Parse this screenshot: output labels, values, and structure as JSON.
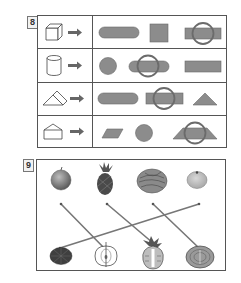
{
  "question_8": {
    "number": "8",
    "rows": [
      {
        "solid": "cube",
        "arrow": "arrow-right",
        "options": [
          "rounded-rectangle",
          "square",
          "rectangle"
        ],
        "circled_option_index": 2
      },
      {
        "solid": "cylinder",
        "arrow": "arrow-right",
        "options": [
          "circle",
          "rounded-rectangle",
          "rectangle"
        ],
        "circled_option_index": 1
      },
      {
        "solid": "triangular-prism",
        "arrow": "arrow-right",
        "options": [
          "rounded-rectangle",
          "rectangle",
          "triangle"
        ],
        "circled_option_index": 1
      },
      {
        "solid": "pentagonal-house-prism",
        "arrow": "arrow-right",
        "options": [
          "parallelogram",
          "circle",
          "trapezoid"
        ],
        "circled_option_index": 2
      }
    ]
  },
  "question_9": {
    "number": "9",
    "top_items": [
      "apple",
      "pineapple",
      "cabbage",
      "orange"
    ],
    "bottom_items": [
      "orange-cross-section",
      "apple-cross-section",
      "pineapple-cross-section",
      "cabbage-cross-section"
    ],
    "connections": [
      {
        "from": "apple",
        "to": "apple-cross-section"
      },
      {
        "from": "pineapple",
        "to": "pineapple-cross-section"
      },
      {
        "from": "cabbage",
        "to": "cabbage-cross-section"
      },
      {
        "from": "orange",
        "to": "orange-cross-section"
      }
    ]
  },
  "colors": {
    "shape_fill": "#8c8c8c",
    "shape_stroke": "#6a6a6a",
    "circle_mark": "#6b6b6b",
    "line": "#777777",
    "border": "#555555"
  }
}
